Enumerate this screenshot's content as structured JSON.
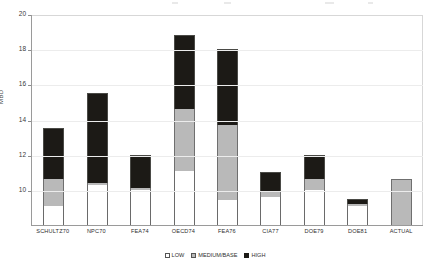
{
  "chart_data": {
    "type": "bar",
    "stacked": true,
    "title": "",
    "xlabel": "",
    "ylabel": "MBD",
    "ylim": [
      8,
      20
    ],
    "ytick_labels": [
      "20",
      "18",
      "16",
      "14",
      "12",
      "10"
    ],
    "yticks": [
      20,
      18,
      16,
      14,
      12,
      10
    ],
    "grid": true,
    "legend_position": "bottom",
    "categories": [
      "SCHULTZ70",
      "NPC70",
      "FEA74",
      "OECD74",
      "FEA76",
      "CIA77",
      "DOE79",
      "DOE81",
      "ACTUAL"
    ],
    "series": [
      {
        "name": "LOW",
        "values": [
          9.1,
          10.3,
          10.0,
          11.1,
          9.4,
          9.6,
          10.0,
          9.1,
          null
        ]
      },
      {
        "name": "MEDIUM/BASE",
        "values": [
          10.6,
          10.4,
          10.1,
          14.6,
          13.7,
          9.9,
          10.6,
          9.2,
          10.6
        ]
      },
      {
        "name": "HIGH",
        "values": [
          13.5,
          15.5,
          12.0,
          18.8,
          18.0,
          11.0,
          12.0,
          9.5,
          null
        ]
      }
    ]
  },
  "axis": {
    "y_title": "MBD",
    "ticks": [
      {
        "label": "20",
        "value": 20
      },
      {
        "label": "18",
        "value": 18
      },
      {
        "label": "16",
        "value": 16
      },
      {
        "label": "14",
        "value": 14
      },
      {
        "label": "12",
        "value": 12
      },
      {
        "label": "10",
        "value": 10
      }
    ]
  },
  "legend": {
    "items": [
      {
        "label": "LOW",
        "color": "#ffffff"
      },
      {
        "label": "MEDIUM/BASE",
        "color": "#b9b9b9"
      },
      {
        "label": "HIGH",
        "color": "#1c1a16"
      }
    ]
  },
  "colors": {
    "low": "#ffffff",
    "base": "#b9b9b9",
    "high": "#1c1a16",
    "axis": "#9a9a9a",
    "grid": "#ececec",
    "background": "#ffffff"
  }
}
